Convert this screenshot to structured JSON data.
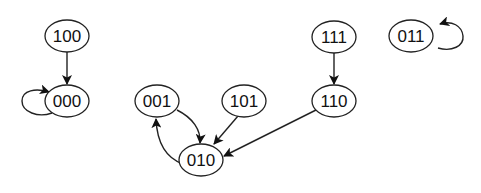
{
  "diagram": {
    "type": "state-transition-graph",
    "nodes": [
      {
        "id": "100",
        "label": "100",
        "cx": 67,
        "cy": 36
      },
      {
        "id": "000",
        "label": "000",
        "cx": 67,
        "cy": 101
      },
      {
        "id": "001",
        "label": "001",
        "cx": 157,
        "cy": 101
      },
      {
        "id": "101",
        "label": "101",
        "cx": 244,
        "cy": 101
      },
      {
        "id": "110",
        "label": "110",
        "cx": 334,
        "cy": 101
      },
      {
        "id": "111",
        "label": "111",
        "cx": 334,
        "cy": 37
      },
      {
        "id": "011",
        "label": "011",
        "cx": 411,
        "cy": 36
      },
      {
        "id": "010",
        "label": "010",
        "cx": 201,
        "cy": 160
      }
    ],
    "edges": [
      {
        "from": "100",
        "to": "000"
      },
      {
        "from": "000",
        "to": "000",
        "self_loop": true
      },
      {
        "from": "001",
        "to": "010"
      },
      {
        "from": "010",
        "to": "001"
      },
      {
        "from": "101",
        "to": "010"
      },
      {
        "from": "110",
        "to": "010"
      },
      {
        "from": "111",
        "to": "110"
      },
      {
        "from": "011",
        "to": "011",
        "self_loop": true
      }
    ]
  }
}
